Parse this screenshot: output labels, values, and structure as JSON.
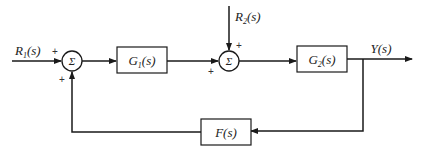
{
  "diagram": {
    "type": "block-diagram",
    "inputs": [
      {
        "id": "r1",
        "label": "R",
        "subscript": "1",
        "suffix": "(s)"
      },
      {
        "id": "r2",
        "label": "R",
        "subscript": "2",
        "suffix": "(s)"
      }
    ],
    "output": {
      "label": "Y(s)"
    },
    "summing_junctions": [
      {
        "id": "sum1",
        "symbol": "Σ",
        "signs": [
          "+",
          "+"
        ]
      },
      {
        "id": "sum2",
        "symbol": "Σ",
        "signs": [
          "+",
          "+"
        ]
      }
    ],
    "blocks": [
      {
        "id": "g1",
        "label": "G",
        "subscript": "1",
        "suffix": "(s)"
      },
      {
        "id": "g2",
        "label": "G",
        "subscript": "2",
        "suffix": "(s)"
      },
      {
        "id": "f",
        "label": "F(s)"
      }
    ],
    "colors": {
      "line": "#1a1a1a",
      "background": "#ffffff",
      "box_fill": "#ffffff"
    }
  }
}
